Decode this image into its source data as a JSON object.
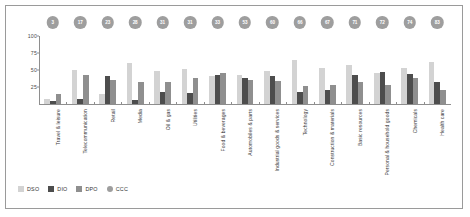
{
  "chart_data": {
    "type": "bar",
    "title": "",
    "xlabel": "",
    "ylabel": "Days",
    "ylim": [
      0,
      100
    ],
    "yticks": [
      25,
      50,
      75,
      100
    ],
    "grid": false,
    "legend_position": "bottom-left",
    "categories": [
      "Travel & leisure",
      "Telecommunication",
      "Retail",
      "Media",
      "Oil & gas",
      "Utilities",
      "Food & beverages",
      "Automobiles & parts",
      "Industrial goods & services",
      "Technology",
      "Construction & materials",
      "Basic resources",
      "Personal & household goods",
      "Chemicals",
      "Health care"
    ],
    "series": [
      {
        "name": "DSO",
        "color": "#d3d3d3",
        "values": [
          8,
          50,
          15,
          61,
          49,
          51,
          41,
          43,
          49,
          65,
          53,
          57,
          46,
          53,
          62
        ]
      },
      {
        "name": "DIO",
        "color": "#4d4d4d",
        "values": [
          5,
          7,
          41,
          6,
          17,
          16,
          43,
          38,
          41,
          18,
          20,
          42,
          47,
          44,
          33
        ]
      },
      {
        "name": "DPO",
        "color": "#8f8f8f",
        "values": [
          14,
          42,
          36,
          32,
          32,
          38,
          46,
          35,
          34,
          27,
          28,
          33,
          28,
          38,
          21
        ]
      },
      {
        "name": "CCC",
        "color": "#9e9e9e",
        "values": [
          3,
          17,
          23,
          28,
          31,
          31,
          33,
          53,
          60,
          66,
          67,
          71,
          72,
          74,
          83
        ]
      }
    ]
  },
  "legend": {
    "items": [
      {
        "label": "DSO",
        "shape": "square",
        "color": "#d3d3d3"
      },
      {
        "label": "DIO",
        "shape": "square",
        "color": "#4d4d4d"
      },
      {
        "label": "DPO",
        "shape": "square",
        "color": "#8f8f8f"
      },
      {
        "label": "CCC",
        "shape": "circle",
        "color": "#9e9e9e"
      }
    ]
  }
}
